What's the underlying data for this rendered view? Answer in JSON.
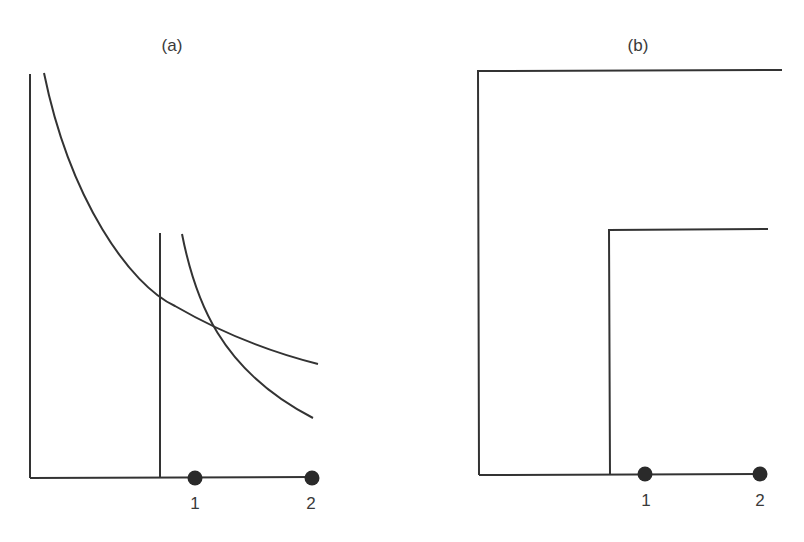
{
  "figure": {
    "panels": [
      {
        "id": "a",
        "label": "(a)",
        "x_ticks": [
          {
            "label": "1"
          },
          {
            "label": "2"
          }
        ],
        "curves": [
          "steep-decreasing-curve",
          "shallow-decreasing-curve"
        ],
        "vertical_line": "vertical-threshold-line"
      },
      {
        "id": "b",
        "label": "(b)",
        "x_ticks": [
          {
            "label": "1"
          },
          {
            "label": "2"
          }
        ],
        "shapes": [
          "outer-step-boundary",
          "inner-step-boundary"
        ]
      }
    ],
    "colors": {
      "line": "#333333",
      "dot": "#2a2a2a",
      "text": "#3a3a3a",
      "background": "#ffffff"
    }
  }
}
